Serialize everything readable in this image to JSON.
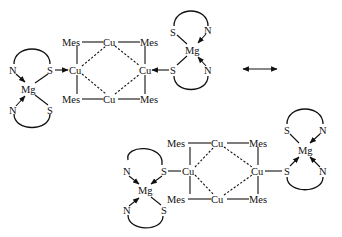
{
  "diagram": {
    "type": "chemical-resonance-structures",
    "resonance_arrow": "double-headed-arrow",
    "structure_a": {
      "core": {
        "top": [
          "Mes",
          "Cu",
          "Mes"
        ],
        "middle": [
          "Cu",
          "Cu"
        ],
        "bottom": [
          "Mes",
          "Cu",
          "Mes"
        ]
      },
      "left_complex": {
        "metal": "Mg",
        "donors": [
          "N",
          "S",
          "N",
          "S"
        ]
      },
      "right_complex": {
        "metal": "Mg",
        "donors": [
          "S",
          "N",
          "S",
          "N"
        ]
      },
      "bonding": "S→Cu dative bonds on both sides"
    },
    "structure_b": {
      "core": {
        "top": [
          "Mes",
          "Cu",
          "Mes"
        ],
        "middle": [
          "Cu",
          "Cu"
        ],
        "bottom": [
          "Mes",
          "Cu",
          "Mes"
        ]
      },
      "left_complex": {
        "metal": "Mg",
        "donors": [
          "N",
          "S",
          "N",
          "S"
        ]
      },
      "right_complex": {
        "metal": "Mg",
        "donors": [
          "S",
          "N",
          "S",
          "N"
        ]
      },
      "bonding": "S–Cu covalent bonds, S→Mg dative bonds"
    }
  },
  "labels": {
    "mes": "Mes",
    "cu": "Cu",
    "mg": "Mg",
    "s": "S",
    "n": "N"
  }
}
